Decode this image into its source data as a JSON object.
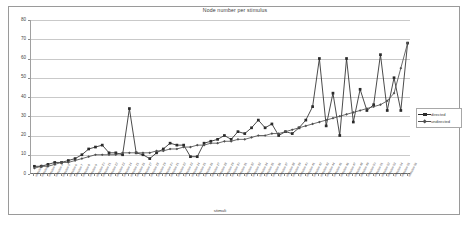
{
  "chart_data": {
    "type": "line",
    "title": "Node number per stimulus",
    "xlabel": "stimuli",
    "ylabel": "",
    "ylim": [
      0,
      80
    ],
    "ytick_values": [
      0,
      10,
      20,
      30,
      40,
      50,
      60,
      70,
      80
    ],
    "grid": true,
    "legend_position": "right",
    "categories": [
      "stimulus 1",
      "stimulus 2",
      "stimulus 3",
      "stimulus 4",
      "stimulus 5",
      "stimulus 6",
      "stimulus 7",
      "stimulus 8",
      "stimulus 9",
      "stimulus 10",
      "stimulus 11",
      "stimulus 12",
      "stimulus 13",
      "stimulus 14",
      "stimulus 15",
      "stimulus 16",
      "stimulus 17",
      "stimulus 18",
      "stimulus 19",
      "stimulus 20",
      "stimulus 21",
      "stimulus 22",
      "stimulus 23",
      "stimulus 24",
      "stimulus 25",
      "stimulus 26",
      "stimulus 27",
      "stimulus 28",
      "stimulus 29",
      "stimulus 30",
      "stimulus 31",
      "stimulus 32",
      "stimulus 33",
      "stimulus 34",
      "stimulus 35",
      "stimulus 36",
      "stimulus 37",
      "stimulus 38",
      "stimulus 39",
      "stimulus 40",
      "stimulus 41",
      "stimulus 42",
      "stimulus 43",
      "stimulus 44",
      "stimulus 45",
      "stimulus 46",
      "stimulus 47",
      "stimulus 48",
      "stimulus 49",
      "stimulus 50",
      "stimulus 51",
      "stimulus 52",
      "stimulus 53",
      "stimulus 54",
      "stimulus 55",
      "stimulus 56"
    ],
    "series": [
      {
        "name": "directed",
        "marker": "square",
        "color": "#2b2b2b",
        "values": [
          4,
          4,
          5,
          6,
          6,
          7,
          8,
          10,
          13,
          14,
          15,
          11,
          11,
          10,
          34,
          11,
          10,
          8,
          11,
          13,
          16,
          15,
          15,
          9,
          9,
          16,
          17,
          18,
          20,
          18,
          22,
          21,
          24,
          28,
          24,
          26,
          20,
          22,
          21,
          24,
          28,
          35,
          60,
          25,
          42,
          20,
          60,
          27,
          44,
          33,
          36,
          62,
          33,
          50,
          33,
          68
        ]
      },
      {
        "name": "undirected",
        "marker": "diamond",
        "color": "#4f4f4f",
        "values": [
          3,
          4,
          4,
          5,
          6,
          6,
          7,
          8,
          9,
          10,
          10,
          10,
          10,
          11,
          11,
          11,
          11,
          11,
          12,
          12,
          13,
          13,
          14,
          14,
          15,
          15,
          16,
          16,
          17,
          17,
          18,
          18,
          19,
          20,
          20,
          21,
          21,
          22,
          23,
          24,
          25,
          26,
          27,
          28,
          29,
          30,
          31,
          32,
          33,
          34,
          35,
          36,
          38,
          42,
          55,
          68
        ]
      }
    ]
  },
  "legend": {
    "items": [
      {
        "label": "directed"
      },
      {
        "label": "undirected"
      }
    ]
  }
}
